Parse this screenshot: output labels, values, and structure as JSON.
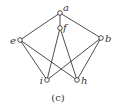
{
  "diagram": {
    "caption": "(c)",
    "nodes": [
      {
        "id": "a",
        "label": "a"
      },
      {
        "id": "f",
        "label": "f"
      },
      {
        "id": "e",
        "label": "e"
      },
      {
        "id": "b",
        "label": "b"
      },
      {
        "id": "i",
        "label": "i"
      },
      {
        "id": "h",
        "label": "h"
      }
    ],
    "edges": [
      [
        "a",
        "e"
      ],
      [
        "a",
        "b"
      ],
      [
        "a",
        "f"
      ],
      [
        "f",
        "i"
      ],
      [
        "f",
        "h"
      ],
      [
        "e",
        "i"
      ],
      [
        "e",
        "h"
      ],
      [
        "b",
        "i"
      ],
      [
        "b",
        "h"
      ]
    ]
  }
}
